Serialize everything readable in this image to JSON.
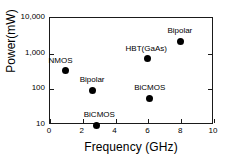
{
  "chart_data": {
    "type": "scatter",
    "title": "",
    "xlabel": "Frequency (GHz)",
    "ylabel": "Power(mW)",
    "xscale": "linear",
    "yscale": "log",
    "xlim": [
      0,
      10
    ],
    "ylim": [
      10,
      10000
    ],
    "grid": false,
    "legend": "none",
    "xticks": [
      {
        "value": 0,
        "label": "0"
      },
      {
        "value": 2,
        "label": "2"
      },
      {
        "value": 4,
        "label": "4"
      },
      {
        "value": 6,
        "label": "6"
      },
      {
        "value": 8,
        "label": "8"
      },
      {
        "value": 10,
        "label": "10"
      }
    ],
    "yticks": [
      {
        "value": 10000,
        "label": "10,000"
      },
      {
        "value": 1000,
        "label": "1,000"
      },
      {
        "value": 100,
        "label": "100"
      },
      {
        "value": 10,
        "label": "10"
      }
    ],
    "points": [
      {
        "label": "NMOS",
        "x": 0.95,
        "y": 330,
        "label_dx": -16,
        "label_dy": -14
      },
      {
        "label": "Bipolar",
        "x": 2.6,
        "y": 95,
        "label_dx": -12,
        "label_dy": -14
      },
      {
        "label": "BiCMOS",
        "x": 2.85,
        "y": 10,
        "label_dx": -12,
        "label_dy": -14
      },
      {
        "label": "HBT(GaAs)",
        "x": 5.95,
        "y": 720,
        "label_dx": -21,
        "label_dy": -14
      },
      {
        "label": "BiCMOS",
        "x": 6.05,
        "y": 57,
        "label_dx": -14,
        "label_dy": -14
      },
      {
        "label": "Bipolar",
        "x": 7.95,
        "y": 2200,
        "label_dx": -12,
        "label_dy": -14
      }
    ]
  }
}
